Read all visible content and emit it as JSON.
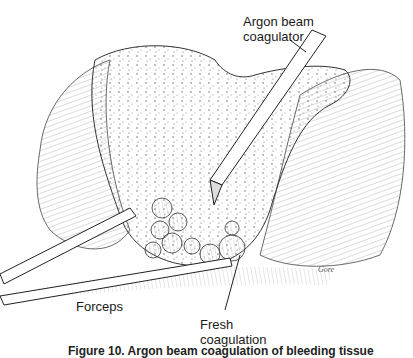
{
  "labels": {
    "argon": "Argon beam\ncoagulator",
    "argon_line1": "Argon beam",
    "argon_line2": "coagulator",
    "forceps": "Forceps",
    "fresh_line1": "Fresh",
    "fresh_line2": "coagulation"
  },
  "signature": "Gore",
  "caption": "Figure 10. Argon beam coagulation of bleeding tissue"
}
